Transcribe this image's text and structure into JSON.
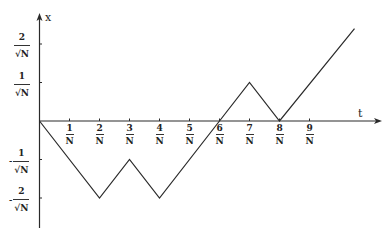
{
  "chart_data": {
    "type": "line",
    "title": "",
    "xlabel": "t",
    "ylabel": "x",
    "x_ticks": [
      {
        "value": 1,
        "num": "1",
        "den": "N"
      },
      {
        "value": 2,
        "num": "2",
        "den": "N"
      },
      {
        "value": 3,
        "num": "3",
        "den": "N"
      },
      {
        "value": 4,
        "num": "4",
        "den": "N"
      },
      {
        "value": 5,
        "num": "5",
        "den": "N"
      },
      {
        "value": 6,
        "num": "6",
        "den": "N"
      },
      {
        "value": 7,
        "num": "7",
        "den": "N"
      },
      {
        "value": 8,
        "num": "8",
        "den": "N"
      },
      {
        "value": 9,
        "num": "9",
        "den": "N"
      }
    ],
    "y_ticks": [
      {
        "value": 2,
        "sign": "",
        "num": "2",
        "den": "√N"
      },
      {
        "value": 1,
        "sign": "",
        "num": "1",
        "den": "√N"
      },
      {
        "value": -1,
        "sign": "-",
        "num": "1",
        "den": "√N"
      },
      {
        "value": -2,
        "sign": "-",
        "num": "2",
        "den": "√N"
      }
    ],
    "series": [
      {
        "name": "random walk path",
        "x": [
          0,
          2,
          3,
          4,
          6,
          7,
          8,
          10.5
        ],
        "y": [
          0,
          -2,
          -1,
          -2,
          0,
          1,
          0,
          2.4
        ]
      }
    ],
    "units": {
      "t": "1/N",
      "x": "1/√N"
    },
    "xlim": [
      0,
      11.3
    ],
    "ylim": [
      -2.8,
      2.8
    ],
    "grid": false,
    "legend": false
  },
  "axes": {
    "x_name": "t",
    "y_name": "x"
  },
  "colors": {
    "line": "#2a2a2a",
    "axis": "#2a2a2a",
    "background": "#ffffff"
  }
}
